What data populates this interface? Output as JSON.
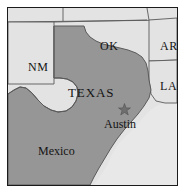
{
  "figure": {
    "kind": "reference-map",
    "frame_border_color": "#1b1b1b",
    "background_color": "#ffffff"
  },
  "palette": {
    "highlight_fill": "#969696",
    "neighbor_fill": "#e3e3e3",
    "water_fill": "#e8e8e8",
    "border_line": "#5a5a5a",
    "frame_line": "#1b1b1b",
    "label_color": "#141414"
  },
  "regions": [
    {
      "id": "texas",
      "label": "TEXAS",
      "type": "state",
      "fill": "#969696",
      "highlighted": true
    },
    {
      "id": "oklahoma",
      "label": "OK",
      "type": "state",
      "fill": "#e3e3e3",
      "highlighted": false
    },
    {
      "id": "new-mexico",
      "label": "NM",
      "type": "state",
      "fill": "#e3e3e3",
      "highlighted": false
    },
    {
      "id": "arkansas",
      "label": "AR",
      "type": "state",
      "fill": "#e3e3e3",
      "highlighted": false
    },
    {
      "id": "louisiana",
      "label": "LA",
      "type": "state",
      "fill": "#e3e3e3",
      "highlighted": false
    },
    {
      "id": "mexico",
      "label": "Mexico",
      "type": "country",
      "fill": "#969696",
      "highlighted": false
    }
  ],
  "markers": [
    {
      "id": "austin",
      "label": "Austin",
      "icon": "star-icon",
      "kind": "capital-city",
      "x": 116,
      "y": 102
    }
  ],
  "labels": {
    "texas": "TEXAS",
    "oklahoma": "OK",
    "new_mexico": "NM",
    "arkansas": "AR",
    "louisiana": "LA",
    "mexico": "Mexico",
    "austin": "Austin"
  }
}
